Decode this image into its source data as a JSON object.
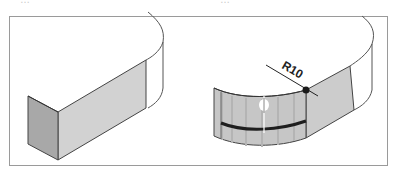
{
  "top_fragment": {
    "left_text": "…",
    "right_text": "…"
  },
  "figure": {
    "left_panel": {
      "description": "block-before-fillet"
    },
    "right_panel": {
      "description": "block-with-fillet",
      "dimension_label": "R10"
    }
  },
  "colors": {
    "frame": "#9a9a9a",
    "outline": "#444444",
    "face_dark": "#a9a9a9",
    "face_light": "#cfcfcf",
    "fillet_face": "#c4c4c4",
    "stripe": "#222222",
    "background": "#ffffff"
  }
}
